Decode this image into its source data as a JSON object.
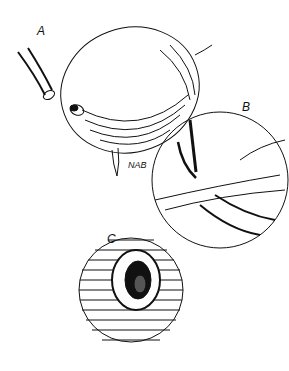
{
  "figure": {
    "panels": [
      {
        "label": "A",
        "description": "Distended bladder with catheter tube and incision"
      },
      {
        "label": "B",
        "description": "Magnified circular inset showing tube insertion through wall, arrow indicating direction"
      },
      {
        "label": "C",
        "description": "Circular inset showing sutured stoma opening"
      }
    ],
    "signature": "NAB"
  }
}
